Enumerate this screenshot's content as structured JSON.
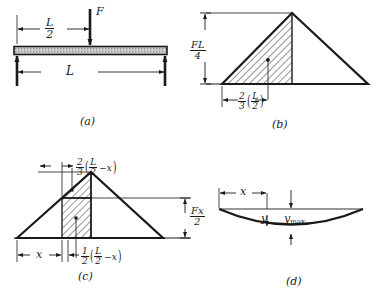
{
  "figure": {
    "background": "#ffffff",
    "ink": "#1a1a1a",
    "beam_fill": "#c9c9c9"
  },
  "panels": [
    {
      "id": "a",
      "label": "(a)",
      "caption": "Loaded beam",
      "dimensions": [
        {
          "name": "half-span",
          "num": "L",
          "den": "2"
        },
        {
          "name": "span",
          "text": "L"
        }
      ],
      "force_label": "F"
    },
    {
      "id": "b",
      "label": "(b)",
      "caption": "Bending moment diagram",
      "dimensions": [
        {
          "name": "peak-moment",
          "num": "FL",
          "den": "4"
        },
        {
          "name": "centroid-distance",
          "num": "2",
          "den": "3",
          "inner_num": "L",
          "inner_den": "2"
        }
      ]
    },
    {
      "id": "c",
      "label": "(c)",
      "caption": "Moment area for deflection at x",
      "dimensions": [
        {
          "name": "distance-x",
          "text": "x"
        },
        {
          "name": "ordinate",
          "num": "Fx",
          "den": "2"
        },
        {
          "name": "triangle-centroid",
          "num": "2",
          "den": "3",
          "inner_num": "L",
          "inner_den": "2",
          "inner_tail": "-x"
        },
        {
          "name": "rect-centroid",
          "num": "1",
          "den": "2",
          "inner_num": "L",
          "inner_den": "2",
          "inner_tail": "-x"
        }
      ]
    },
    {
      "id": "d",
      "label": "(d)",
      "caption": "Deflection curve",
      "dimensions": [
        {
          "name": "distance-x",
          "text": "x"
        },
        {
          "name": "deflection",
          "text": "y"
        },
        {
          "name": "max-deflection",
          "text": "y",
          "sub": "max"
        }
      ]
    }
  ],
  "labels": {
    "force": "F",
    "span": "L",
    "half_span_num": "L",
    "half_span_den": "2",
    "moment_num": "FL",
    "moment_den": "4",
    "two_thirds_num": "2",
    "two_thirds_den": "3",
    "half_num": "1",
    "half_den": "2",
    "inner_L": "L",
    "inner_2": "2",
    "minus_x": "−x",
    "fx_num": "Fx",
    "fx_den": "2",
    "x": "x",
    "y": "y",
    "ymax_base": "y",
    "ymax_sub": "max",
    "panel_a": "(a)",
    "panel_b": "(b)",
    "panel_c": "(c)",
    "panel_d": "(d)"
  }
}
